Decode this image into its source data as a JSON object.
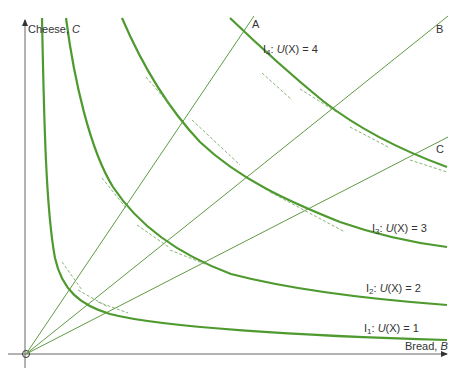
{
  "diagram": {
    "type": "indifference-map",
    "axes": {
      "y_label": "Cheese,",
      "y_var": "C",
      "x_label": "Bread,",
      "x_var": "B"
    },
    "rays": [
      {
        "label": "A"
      },
      {
        "label": "B"
      },
      {
        "label": "C"
      }
    ],
    "curves": [
      {
        "name": "I",
        "sub": "1",
        "text": ": ",
        "func": "U",
        "arg": "(X)",
        "value": "= 1"
      },
      {
        "name": "I",
        "sub": "2",
        "text": ": ",
        "func": "U",
        "arg": "(X)",
        "value": "= 2"
      },
      {
        "name": "I",
        "sub": "3",
        "text": ": ",
        "func": "U",
        "arg": "(X)",
        "value": "= 3"
      },
      {
        "name": "I",
        "sub": "4",
        "text": ": ",
        "func": "U",
        "arg": "(X)",
        "value": "= 4"
      }
    ],
    "colors": {
      "curve": "#4e9a2f",
      "ray": "#5f9a45",
      "axis": "#555555",
      "tangent": "#7aa868"
    }
  }
}
